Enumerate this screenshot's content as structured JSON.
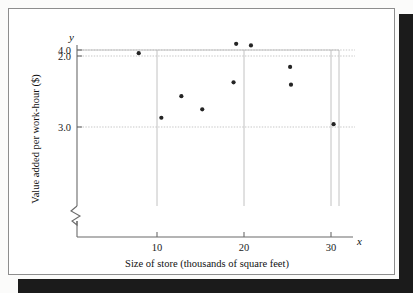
{
  "figure": {
    "background_color": "#ffffff",
    "shadow_color": "#1b1b1b",
    "border_color": "#8d8d8d"
  },
  "chart_data": {
    "type": "scatter",
    "title": "",
    "xlabel": "Size of store (thousands of square feet)",
    "ylabel": "Value added per work-hour ($)",
    "x_axis_symbol": "x",
    "y_axis_symbol": "y",
    "xlim": [
      4,
      33
    ],
    "ylim": [
      1.85,
      4.3
    ],
    "xticks": [
      10,
      20,
      30
    ],
    "xtick_labels": [
      "10",
      "20",
      "30"
    ],
    "yticks": [
      2.0,
      3.0,
      4.0
    ],
    "ytick_labels": [
      "2.0",
      "3.0",
      "4.0"
    ],
    "grid": "horizontal dashed at y ticks, vertical solid at x ticks",
    "legend": "none",
    "y_axis_break": true,
    "marker_color": "#242424",
    "points": [
      {
        "x": 7.9,
        "y": 1.96
      },
      {
        "x": 10.5,
        "y": 3.12
      },
      {
        "x": 12.8,
        "y": 3.4
      },
      {
        "x": 15.2,
        "y": 3.23
      },
      {
        "x": 18.8,
        "y": 3.58
      },
      {
        "x": 19.1,
        "y": 4.08
      },
      {
        "x": 20.8,
        "y": 4.06
      },
      {
        "x": 25.3,
        "y": 3.78
      },
      {
        "x": 25.4,
        "y": 3.55
      },
      {
        "x": 30.3,
        "y": 2.96
      }
    ]
  }
}
